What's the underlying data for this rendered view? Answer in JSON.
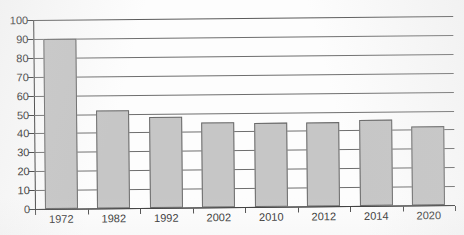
{
  "chart_data": {
    "type": "bar",
    "title": "",
    "xlabel": "",
    "ylabel": "",
    "ylim": [
      0,
      100
    ],
    "ytick_step": 10,
    "grid": true,
    "legend": "none",
    "categories": [
      "1972",
      "1982",
      "1992",
      "2002",
      "2010",
      "2012",
      "2014",
      "2020"
    ],
    "values": [
      90,
      52,
      48,
      45,
      44.5,
      44.5,
      45.5,
      42
    ],
    "ytick_labels": [
      "0",
      "10",
      "20",
      "30",
      "40",
      "50",
      "60",
      "70",
      "80",
      "90",
      "100"
    ]
  },
  "style": {
    "bar_fill": "#c6c6c6",
    "bar_border": "#6a6a6a",
    "gridline_color": "#6e6e6e",
    "axis_color": "#3a3a3a",
    "text_color": "#2a2a2a",
    "background": "#fdfdfd"
  }
}
